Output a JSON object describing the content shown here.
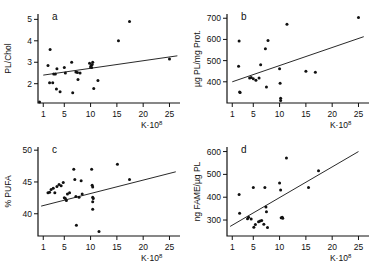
{
  "figure": {
    "name": "four-panel-scatter-figure",
    "xlabel_main": "K",
    "xlabel_dot": "·",
    "xlabel_base": "10",
    "xlabel_exp": "8"
  },
  "chart_data": [
    {
      "type": "scatter",
      "panel": "a",
      "title": "",
      "xlabel": "K·10⁸",
      "ylabel": "PL/Chol",
      "xlim": [
        0,
        27
      ],
      "ylim": [
        1.1,
        5.25
      ],
      "xticks": [
        1,
        5,
        10,
        15,
        20,
        25
      ],
      "xticklabels": [
        "1",
        "5",
        "10",
        "15",
        "20",
        "25"
      ],
      "yticks": [
        2,
        3,
        4,
        5
      ],
      "yticklabels": [
        "2",
        "3",
        "4",
        "5"
      ],
      "grid": false,
      "legend": "none",
      "points": [
        [
          0.3,
          1.15
        ],
        [
          2.3,
          3.6
        ],
        [
          1.9,
          2.85
        ],
        [
          3.0,
          2.45
        ],
        [
          3.3,
          2.45
        ],
        [
          3.6,
          2.7
        ],
        [
          2.2,
          2.05
        ],
        [
          2.8,
          2.05
        ],
        [
          3.5,
          1.75
        ],
        [
          4.2,
          1.62
        ],
        [
          5.0,
          2.75
        ],
        [
          5.2,
          2.5
        ],
        [
          6.4,
          3.0
        ],
        [
          6.6,
          1.58
        ],
        [
          7.2,
          2.55
        ],
        [
          7.5,
          2.52
        ],
        [
          7.6,
          2.2
        ],
        [
          8.0,
          2.5
        ],
        [
          9.8,
          2.95
        ],
        [
          10.1,
          2.85
        ],
        [
          10.2,
          2.75
        ],
        [
          10.3,
          2.9
        ],
        [
          10.4,
          3.0
        ],
        [
          10.0,
          2.78
        ],
        [
          10.6,
          1.78
        ],
        [
          11.4,
          2.15
        ],
        [
          15.3,
          4.0
        ],
        [
          17.4,
          4.9
        ],
        [
          25.0,
          3.15
        ]
      ],
      "fit": {
        "x1": 1.0,
        "y1": 2.4,
        "x2": 26.5,
        "y2": 3.3
      }
    },
    {
      "type": "scatter",
      "panel": "b",
      "title": "",
      "xlabel": "K·10⁸",
      "ylabel": "µg PL/mg Prot.",
      "xlim": [
        0,
        27
      ],
      "ylim": [
        300,
        720
      ],
      "xticks": [
        1,
        5,
        10,
        15,
        20,
        25
      ],
      "xticklabels": [
        "1",
        "5",
        "10",
        "15",
        "20",
        "25"
      ],
      "yticks": [
        400,
        500,
        600,
        700
      ],
      "yticklabels": [
        "400",
        "500",
        "600",
        "700"
      ],
      "grid": false,
      "legend": "none",
      "points": [
        [
          2.3,
          592
        ],
        [
          2.2,
          474
        ],
        [
          2.4,
          352
        ],
        [
          2.5,
          350
        ],
        [
          4.3,
          418
        ],
        [
          4.6,
          420
        ],
        [
          5.0,
          414
        ],
        [
          5.5,
          407
        ],
        [
          6.1,
          418
        ],
        [
          6.4,
          480
        ],
        [
          7.3,
          556
        ],
        [
          7.8,
          595
        ],
        [
          7.5,
          375
        ],
        [
          10.0,
          462
        ],
        [
          10.1,
          393
        ],
        [
          10.2,
          322
        ],
        [
          10.2,
          312
        ],
        [
          11.4,
          672
        ],
        [
          15.0,
          450
        ],
        [
          16.8,
          445
        ],
        [
          25.0,
          703
        ]
      ],
      "fit": {
        "x1": 1.0,
        "y1": 400,
        "x2": 26.0,
        "y2": 613
      }
    },
    {
      "type": "scatter",
      "panel": "c",
      "title": "",
      "xlabel": "K·10⁸",
      "ylabel": "% PUFA",
      "xlim": [
        0,
        27
      ],
      "ylim": [
        36.5,
        50.5
      ],
      "xticks": [
        1,
        5,
        10,
        15,
        20,
        25
      ],
      "xticklabels": [
        "1",
        "5",
        "10",
        "15",
        "20",
        "25"
      ],
      "yticks": [
        40,
        45,
        50
      ],
      "yticklabels": [
        "40",
        "45",
        "50"
      ],
      "grid": false,
      "legend": "none",
      "points": [
        [
          1.9,
          43.3
        ],
        [
          2.2,
          43.4
        ],
        [
          2.5,
          43.8
        ],
        [
          2.9,
          44.0
        ],
        [
          3.2,
          43.3
        ],
        [
          3.6,
          44.3
        ],
        [
          4.0,
          44.6
        ],
        [
          4.4,
          44.4
        ],
        [
          4.8,
          44.9
        ],
        [
          5.0,
          42.5
        ],
        [
          5.2,
          42.4
        ],
        [
          5.4,
          42.1
        ],
        [
          5.6,
          43.1
        ],
        [
          6.0,
          43.3
        ],
        [
          6.8,
          47.0
        ],
        [
          7.0,
          45.4
        ],
        [
          7.2,
          42.7
        ],
        [
          7.3,
          38.2
        ],
        [
          7.8,
          42.6
        ],
        [
          8.2,
          45.2
        ],
        [
          8.4,
          43.1
        ],
        [
          10.2,
          47.0
        ],
        [
          10.3,
          44.5
        ],
        [
          10.4,
          44.2
        ],
        [
          10.4,
          42.6
        ],
        [
          10.5,
          42.4
        ],
        [
          10.4,
          41.9
        ],
        [
          10.4,
          40.7
        ],
        [
          11.6,
          37.2
        ],
        [
          15.1,
          47.8
        ],
        [
          17.4,
          45.4
        ]
      ],
      "fit": {
        "x1": 0.6,
        "y1": 41.2,
        "x2": 26.2,
        "y2": 46.6
      }
    },
    {
      "type": "scatter",
      "panel": "d",
      "title": "",
      "xlabel": "K·10⁸",
      "ylabel": "ng FAME/µg PL",
      "xlim": [
        0,
        27
      ],
      "ylim": [
        230,
        620
      ],
      "xticks": [
        1,
        5,
        10,
        15,
        20,
        25
      ],
      "xticklabels": [
        "1",
        "5",
        "10",
        "15",
        "20",
        "25"
      ],
      "yticks": [
        300,
        400,
        500,
        600
      ],
      "yticklabels": [
        "300",
        "400",
        "500",
        "600"
      ],
      "grid": false,
      "legend": "none",
      "points": [
        [
          2.3,
          412
        ],
        [
          2.4,
          330
        ],
        [
          3.9,
          306
        ],
        [
          4.1,
          312
        ],
        [
          4.6,
          305
        ],
        [
          5.0,
          443
        ],
        [
          5.1,
          268
        ],
        [
          5.4,
          280
        ],
        [
          6.0,
          292
        ],
        [
          6.3,
          296
        ],
        [
          6.6,
          298
        ],
        [
          7.0,
          282
        ],
        [
          7.2,
          442
        ],
        [
          7.4,
          357
        ],
        [
          7.5,
          336
        ],
        [
          7.7,
          267
        ],
        [
          10.0,
          462
        ],
        [
          10.2,
          432
        ],
        [
          10.3,
          310
        ],
        [
          10.5,
          312
        ],
        [
          10.6,
          308
        ],
        [
          11.3,
          572
        ],
        [
          15.5,
          443
        ],
        [
          17.4,
          516
        ]
      ],
      "fit": {
        "x1": 0.6,
        "y1": 272,
        "x2": 25.0,
        "y2": 600
      }
    }
  ]
}
